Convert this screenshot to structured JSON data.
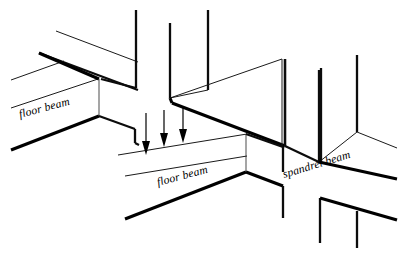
{
  "figure": {
    "kind": "isometric-structural-diagram",
    "background_color": "#ffffff",
    "line_color": "#000000",
    "width": 407,
    "height": 253
  },
  "labels": {
    "floor_beam_left": "floor beam",
    "floor_beam_center": "floor beam",
    "spandrel_beam": "spandrel beam"
  },
  "label_placement": {
    "floor_beam_left": {
      "x": 20,
      "y": 118,
      "rotation": -15
    },
    "floor_beam_center": {
      "x": 158,
      "y": 186,
      "rotation": -15
    },
    "spandrel_beam": {
      "x": 284,
      "y": 178,
      "rotation": -17
    }
  },
  "load_arrows": {
    "count": 3,
    "direction": "down",
    "positions": [
      {
        "x": 146,
        "top_y": 113,
        "bottom_y": 153
      },
      {
        "x": 164,
        "top_y": 110,
        "bottom_y": 146
      },
      {
        "x": 183,
        "top_y": 108,
        "bottom_y": 143
      }
    ]
  },
  "geometry": {
    "columns_vertical": [
      {
        "name": "upper-left-column",
        "x1": 136,
        "y1": 10,
        "x2": 136,
        "y2": 88
      },
      {
        "name": "upper-center-column",
        "x1": 170,
        "y1": 23,
        "x2": 170,
        "y2": 98
      },
      {
        "name": "upper-center-right-column",
        "x1": 208,
        "y1": 10,
        "x2": 208,
        "y2": 90
      },
      {
        "name": "right-column-inner",
        "x1": 282,
        "y1": 59,
        "x2": 282,
        "y2": 146
      },
      {
        "name": "right-column-near",
        "x1": 321,
        "y1": 68,
        "x2": 321,
        "y2": 163
      },
      {
        "name": "far-right-column",
        "x1": 357,
        "y1": 55,
        "x2": 357,
        "y2": 132
      },
      {
        "name": "lower-center-column",
        "x1": 283,
        "y1": 172,
        "x2": 283,
        "y2": 218
      },
      {
        "name": "lower-right-column",
        "x1": 320,
        "y1": 198,
        "x2": 320,
        "y2": 240
      },
      {
        "name": "lower-far-right-column",
        "x1": 357,
        "y1": 215,
        "x2": 357,
        "y2": 243
      },
      {
        "name": "mid-hair-column-a",
        "x1": 99,
        "y1": 79,
        "x2": 99,
        "y2": 116
      },
      {
        "name": "mid-hair-column-b",
        "x1": 246,
        "y1": 134,
        "x2": 246,
        "y2": 172
      },
      {
        "name": "right-corner-column",
        "x1": 337,
        "y1": 132,
        "x2": 337,
        "y2": 168
      }
    ]
  }
}
